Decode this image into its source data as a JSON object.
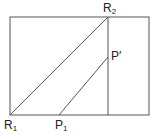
{
  "diagram": {
    "labels": {
      "R1": {
        "main": "R",
        "sub": "1"
      },
      "R2": {
        "main": "R",
        "sub": "2"
      },
      "P1": {
        "main": "P",
        "sub": "1"
      },
      "Pprime": {
        "main": "P′"
      }
    },
    "colors": {
      "stroke": "#555555",
      "text": "#222222"
    }
  }
}
